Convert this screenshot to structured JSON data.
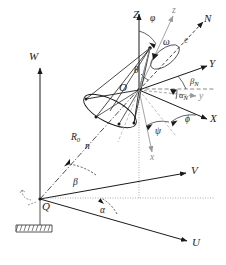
{
  "figure": {
    "kind": "3d-coordinate-geometry-diagram",
    "background_color": "#ffffff",
    "line_color": "#1a1a1a",
    "accent_gray": "#8a8a8a"
  },
  "ground_frame": {
    "origin_label": "Q",
    "axes": [
      {
        "name": "W",
        "label": "W",
        "direction": "up"
      },
      {
        "name": "V",
        "label": "V",
        "direction": "right-up"
      },
      {
        "name": "U",
        "label": "U",
        "direction": "right-down"
      }
    ],
    "angles": [
      {
        "name": "alpha",
        "label": "α"
      },
      {
        "name": "beta",
        "label": "β"
      }
    ],
    "range_vector": {
      "label": "R",
      "subscript": "0",
      "unit_vector_label": "n"
    },
    "support_symbol": "hatched-ground-mount"
  },
  "body_frame": {
    "origin_label": "O",
    "axes": [
      {
        "name": "Z",
        "label": "Z",
        "direction": "up"
      },
      {
        "name": "Y",
        "label": "Y",
        "direction": "right-up"
      },
      {
        "name": "X",
        "label": "X",
        "direction": "right-down"
      }
    ],
    "rotated_axes": [
      {
        "name": "z",
        "label": "z",
        "style": "gray"
      },
      {
        "name": "y",
        "label": "y",
        "style": "gray"
      },
      {
        "name": "x",
        "label": "x",
        "style": "gray"
      }
    ],
    "angles": [
      {
        "name": "varphi",
        "label": "φ"
      },
      {
        "name": "omega",
        "label": "ω"
      },
      {
        "name": "theta",
        "label": "θ"
      },
      {
        "name": "psi",
        "label": "ψ"
      },
      {
        "name": "phi",
        "label": "ϕ"
      },
      {
        "name": "beta_N",
        "label": "β",
        "subscript": "N"
      },
      {
        "name": "alpha_N",
        "label": "α",
        "subscript": "N"
      }
    ]
  },
  "boresight": {
    "axis_label": "N",
    "unit_vector_label": "e",
    "line_style": "dashed"
  },
  "cone": {
    "apex_at": "O",
    "half_angle_label": "θ",
    "base_shape": "ellipse"
  }
}
